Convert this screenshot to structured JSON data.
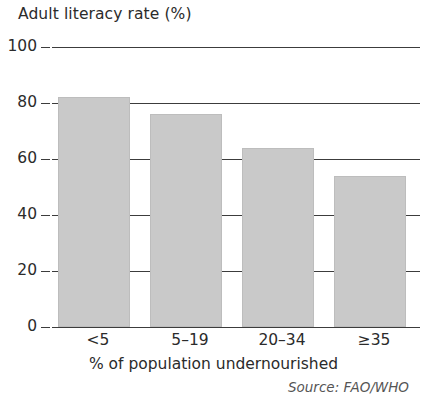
{
  "chart_data": {
    "type": "bar",
    "title": "Adult literacy rate (%)",
    "xlabel": "% of population undernourished",
    "ylabel": "Adult literacy rate (%)",
    "categories": [
      "<5",
      "5–19",
      "20–34",
      "≥35"
    ],
    "values": [
      82,
      76,
      64,
      54
    ],
    "ylim": [
      0,
      100
    ],
    "yticks": [
      0,
      20,
      40,
      60,
      80,
      100
    ],
    "ytick_labels": [
      "0",
      "20",
      "40",
      "60",
      "80",
      "100"
    ],
    "grid": "horizontal",
    "legend": "none",
    "bar_color": "#c9c9c9",
    "axis_color": "#3c3c3c",
    "annotations": [
      "Source: FAO/WHO"
    ]
  },
  "source_note": "Source: FAO/WHO"
}
